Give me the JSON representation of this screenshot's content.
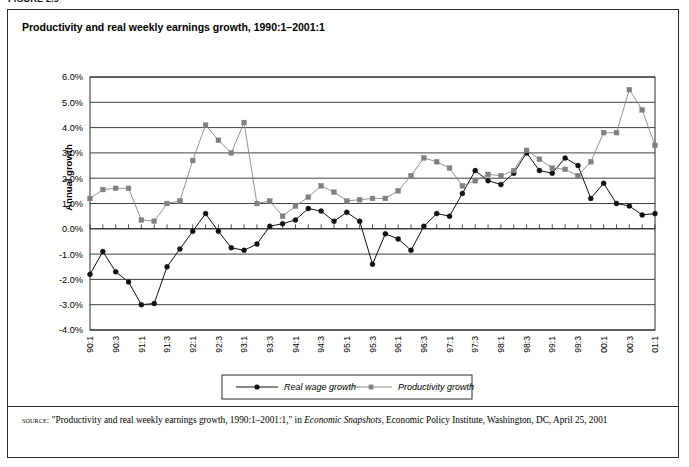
{
  "figure_label": "FIGURE 2.9",
  "chart_title": "Productivity and real weekly earnings growth, 1990:1–2001:1",
  "source": {
    "kicker": "source:",
    "text_part1": "\"Productivity and real weekly earnings growth, 1990:1–2001:1,\" in ",
    "italic": "Economic Snapshots",
    "text_part2": ", Economic Policy Institute, Washington, DC, April 25, 2001"
  },
  "legend": {
    "items": [
      {
        "label": "Real wage growth",
        "marker": "circle",
        "color": "#111111"
      },
      {
        "label": "Productivity growth",
        "marker": "square",
        "color": "#808080"
      }
    ]
  },
  "chart_data": {
    "type": "line",
    "title": "Productivity and real weekly earnings growth, 1990:1–2001:1",
    "xlabel": "",
    "ylabel": "Annual growth",
    "ylim": [
      -4.0,
      6.0
    ],
    "ytick_step": 1.0,
    "ytick_labels": [
      "6.0%",
      "5.0%",
      "4.0%",
      "3.0%",
      "2.0%",
      "1.0%",
      "0.0%",
      "-1.0%",
      "-2.0%",
      "-3.0%",
      "-4.0%"
    ],
    "ytick_values": [
      6.0,
      5.0,
      4.0,
      3.0,
      2.0,
      1.0,
      0.0,
      -1.0,
      -2.0,
      -3.0,
      -4.0
    ],
    "grid": true,
    "legend_position": "bottom",
    "categories": [
      "90:1",
      "90:2",
      "90:3",
      "90:4",
      "91:1",
      "91:2",
      "91:3",
      "91:4",
      "92:1",
      "92:2",
      "92:3",
      "92:4",
      "93:1",
      "93:2",
      "93:3",
      "93:4",
      "94:1",
      "94:2",
      "94:3",
      "94:4",
      "95:1",
      "95:2",
      "95:3",
      "95:4",
      "96:1",
      "96:2",
      "96:3",
      "96:4",
      "97:1",
      "97:2",
      "97:3",
      "97:4",
      "98:1",
      "98:2",
      "98:3",
      "98:4",
      "99:1",
      "99:2",
      "99:3",
      "99:4",
      "00:1",
      "00:2",
      "00:3",
      "00:4",
      "01:1"
    ],
    "xtick_labels": [
      "90:1",
      "90:3",
      "91:1",
      "91:3",
      "92:1",
      "92:3",
      "93:1",
      "93:3",
      "94:1",
      "94:3",
      "95:1",
      "95:3",
      "96:1",
      "96:3",
      "97:1",
      "97:3",
      "98:1",
      "98:3",
      "99:1",
      "99:3",
      "00:1",
      "00:3",
      "01:1"
    ],
    "series": [
      {
        "name": "Real wage growth",
        "marker": "circle",
        "color": "#111111",
        "values": [
          -1.8,
          -0.9,
          -1.7,
          -2.1,
          -3.0,
          -2.95,
          -1.5,
          -0.8,
          -0.1,
          0.6,
          -0.1,
          -0.75,
          -0.85,
          -0.6,
          0.1,
          0.2,
          0.35,
          0.8,
          0.7,
          0.3,
          0.65,
          0.3,
          -1.4,
          -0.2,
          -0.4,
          -0.85,
          0.1,
          0.6,
          0.5,
          1.4,
          2.3,
          1.9,
          1.75,
          2.2,
          3.0,
          2.3,
          2.2,
          2.8,
          2.5,
          1.2,
          1.8,
          1.0,
          0.9,
          0.55,
          0.6
        ]
      },
      {
        "name": "Productivity growth",
        "marker": "square",
        "color": "#808080",
        "values": [
          1.2,
          1.55,
          1.6,
          1.6,
          0.35,
          0.3,
          1.0,
          1.1,
          2.7,
          4.1,
          3.5,
          3.0,
          4.2,
          1.0,
          1.1,
          0.5,
          0.9,
          1.25,
          1.7,
          1.45,
          1.1,
          1.15,
          1.2,
          1.2,
          1.5,
          2.1,
          2.8,
          2.65,
          2.4,
          1.7,
          1.9,
          2.15,
          2.1,
          2.3,
          3.1,
          2.75,
          2.4,
          2.35,
          2.1,
          2.65,
          3.8,
          3.8,
          5.5,
          4.7,
          3.3
        ]
      }
    ]
  },
  "axis_geometry": {
    "plot_left": 90,
    "plot_right": 655,
    "plot_top": 77,
    "plot_bottom": 330
  }
}
